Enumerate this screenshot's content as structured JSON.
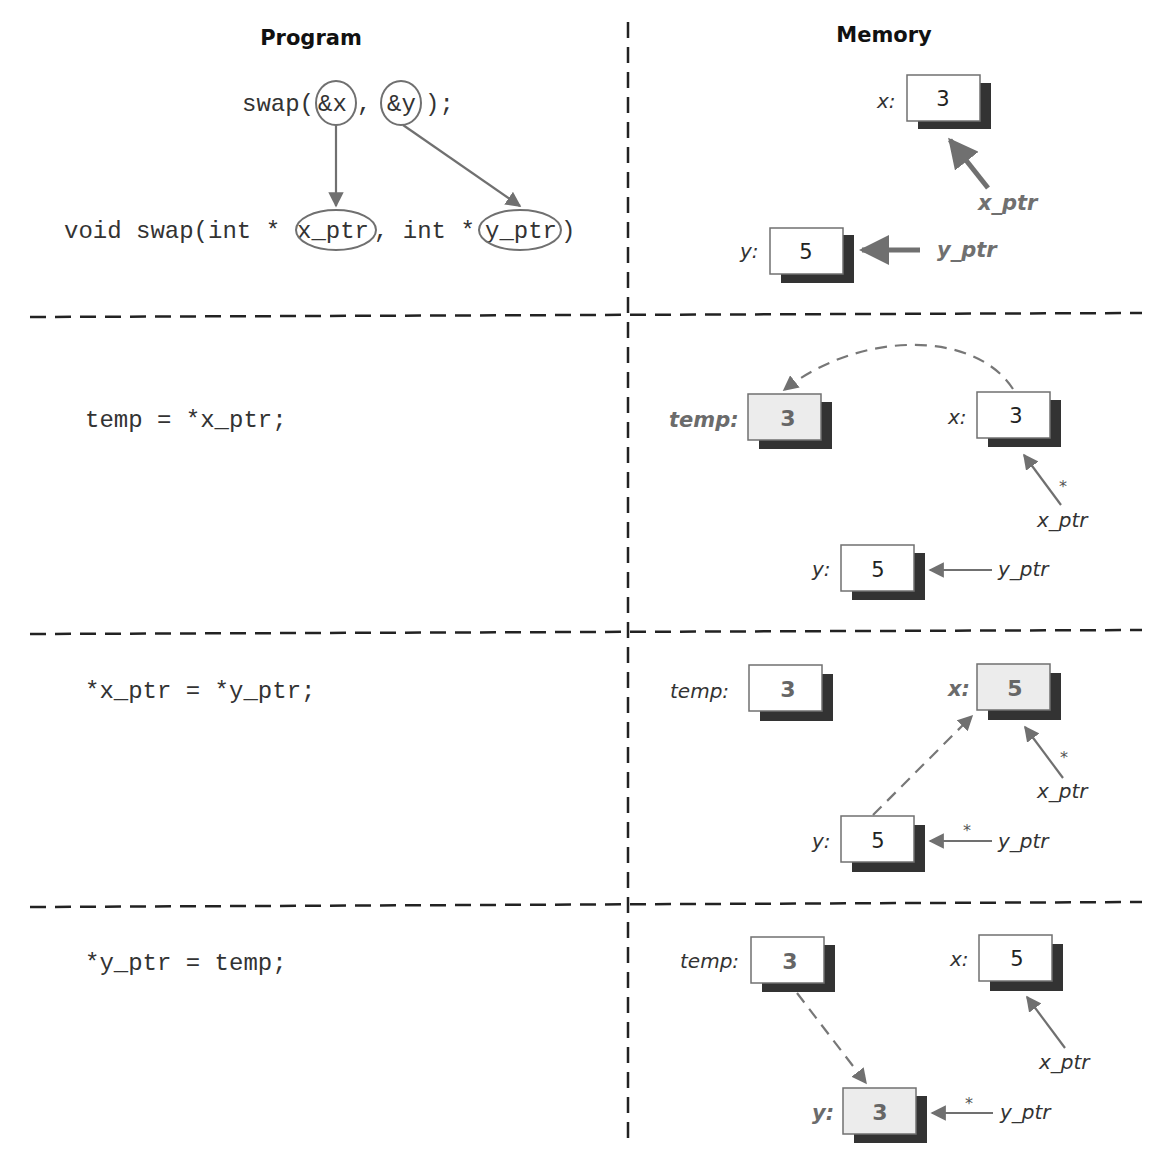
{
  "headers": {
    "program": "Program",
    "memory": "Memory"
  },
  "colors": {
    "arrow": "#707070",
    "shadow": "#333333",
    "box_border": "#707070",
    "highlight_fill": "#ececec",
    "divider": "#222222"
  },
  "steps": [
    {
      "code": [
        "swap(&x, &y);",
        "void swap(int *x_ptr, int *y_ptr)"
      ],
      "code_parts": {
        "call_prefix": "swap(",
        "call_arg1": "&x",
        "call_sep": ",",
        "call_arg2": "&y",
        "call_suffix": ");",
        "decl_prefix": "void swap(int *",
        "decl_param1": "x_ptr",
        "decl_mid": ", int *",
        "decl_param2": "y_ptr",
        "decl_suffix": ")"
      },
      "memory": {
        "x": {
          "label": "x:",
          "value": "3"
        },
        "y": {
          "label": "y:",
          "value": "5"
        },
        "x_ptr": "x_ptr",
        "y_ptr": "y_ptr"
      }
    },
    {
      "code": "temp = *x_ptr;",
      "memory": {
        "temp": {
          "label": "temp:",
          "value": "3",
          "highlighted": true
        },
        "x": {
          "label": "x:",
          "value": "3"
        },
        "y": {
          "label": "y:",
          "value": "5"
        },
        "x_ptr": "x_ptr",
        "y_ptr": "y_ptr",
        "deref_star": "*"
      }
    },
    {
      "code": "*x_ptr = *y_ptr;",
      "memory": {
        "temp": {
          "label": "temp:",
          "value": "3"
        },
        "x": {
          "label": "x:",
          "value": "5",
          "highlighted": true
        },
        "y": {
          "label": "y:",
          "value": "5"
        },
        "x_ptr": "x_ptr",
        "y_ptr": "y_ptr",
        "deref_star_x": "*",
        "deref_star_y": "*"
      }
    },
    {
      "code": "*y_ptr = temp;",
      "memory": {
        "temp": {
          "label": "temp:",
          "value": "3"
        },
        "x": {
          "label": "x:",
          "value": "5"
        },
        "y": {
          "label": "y:",
          "value": "3",
          "highlighted": true
        },
        "x_ptr": "x_ptr",
        "y_ptr": "y_ptr",
        "deref_star_y": "*"
      }
    }
  ]
}
